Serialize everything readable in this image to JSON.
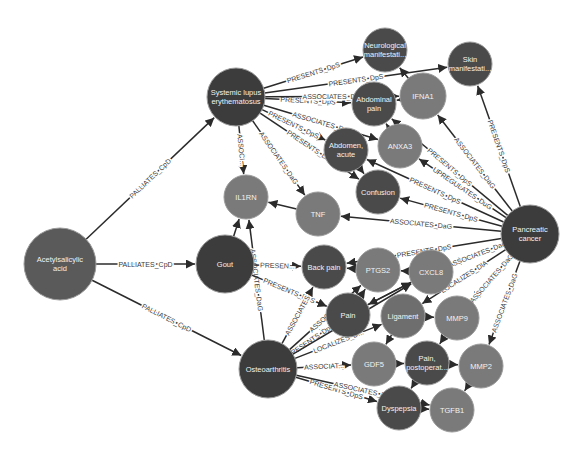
{
  "colors": {
    "background": "#ffffff",
    "compound": "#5a5a5a",
    "disease": "#3c3c3c",
    "symptom": "#4a4a4a",
    "gene": "#7a7a7a",
    "anatomy": "#6e6e6e",
    "edge": "#2b2b2b",
    "label_light": "#f2f2f2"
  },
  "nodes": [
    {
      "id": "acetylsalicylic_acid",
      "lines": [
        "Acetylsalicylic",
        "acid"
      ],
      "x": 60,
      "y": 264,
      "r": 36,
      "type": "compound"
    },
    {
      "id": "sle",
      "lines": [
        "Systemic lupus",
        "erythematosus"
      ],
      "x": 236,
      "y": 97,
      "r": 29,
      "type": "disease"
    },
    {
      "id": "il1rn",
      "lines": [
        "IL1RN"
      ],
      "x": 246,
      "y": 197,
      "r": 22,
      "type": "gene"
    },
    {
      "id": "gout",
      "lines": [
        "Gout"
      ],
      "x": 225,
      "y": 264,
      "r": 29,
      "type": "disease"
    },
    {
      "id": "osteoarthritis",
      "lines": [
        "Osteoarthritis"
      ],
      "x": 268,
      "y": 369,
      "r": 29,
      "type": "disease"
    },
    {
      "id": "neuro",
      "lines": [
        "Neurological",
        "manifestati..."
      ],
      "x": 385,
      "y": 50,
      "r": 22,
      "type": "symptom"
    },
    {
      "id": "skin",
      "lines": [
        "Skin",
        "manifestati..."
      ],
      "x": 470,
      "y": 64,
      "r": 22,
      "type": "symptom"
    },
    {
      "id": "abdominal_pain",
      "lines": [
        "Abdominal",
        "pain"
      ],
      "x": 374,
      "y": 104,
      "r": 22,
      "type": "symptom"
    },
    {
      "id": "ifna1",
      "lines": [
        "IFNA1"
      ],
      "x": 423,
      "y": 96,
      "r": 23,
      "type": "gene"
    },
    {
      "id": "abdomen_acute",
      "lines": [
        "Abdomen,",
        "acute"
      ],
      "x": 346,
      "y": 150,
      "r": 22,
      "type": "symptom"
    },
    {
      "id": "anxa3",
      "lines": [
        "ANXA3"
      ],
      "x": 400,
      "y": 146,
      "r": 22,
      "type": "gene"
    },
    {
      "id": "confusion",
      "lines": [
        "Confusion"
      ],
      "x": 378,
      "y": 192,
      "r": 22,
      "type": "symptom"
    },
    {
      "id": "tnf",
      "lines": [
        "TNF"
      ],
      "x": 318,
      "y": 214,
      "r": 22,
      "type": "gene"
    },
    {
      "id": "pancreatic_cancer",
      "lines": [
        "Pancreatic",
        "cancer"
      ],
      "x": 530,
      "y": 234,
      "r": 29,
      "type": "disease"
    },
    {
      "id": "back_pain",
      "lines": [
        "Back pain"
      ],
      "x": 324,
      "y": 267,
      "r": 22,
      "type": "symptom"
    },
    {
      "id": "ptgs2",
      "lines": [
        "PTGS2"
      ],
      "x": 378,
      "y": 270,
      "r": 22,
      "type": "gene"
    },
    {
      "id": "cxcl8",
      "lines": [
        "CXCL8"
      ],
      "x": 431,
      "y": 272,
      "r": 22,
      "type": "gene"
    },
    {
      "id": "pain",
      "lines": [
        "Pain"
      ],
      "x": 348,
      "y": 315,
      "r": 22,
      "type": "symptom"
    },
    {
      "id": "ligament",
      "lines": [
        "Ligament"
      ],
      "x": 403,
      "y": 316,
      "r": 22,
      "type": "anatomy"
    },
    {
      "id": "mmp9",
      "lines": [
        "MMP9"
      ],
      "x": 457,
      "y": 318,
      "r": 22,
      "type": "gene"
    },
    {
      "id": "gdf5",
      "lines": [
        "GDF5"
      ],
      "x": 374,
      "y": 364,
      "r": 22,
      "type": "gene"
    },
    {
      "id": "pain_postop",
      "lines": [
        "Pain,",
        "postoperat..."
      ],
      "x": 427,
      "y": 363,
      "r": 22,
      "type": "symptom"
    },
    {
      "id": "mmp2",
      "lines": [
        "MMP2"
      ],
      "x": 481,
      "y": 366,
      "r": 22,
      "type": "gene"
    },
    {
      "id": "dyspepsia",
      "lines": [
        "Dyspepsia"
      ],
      "x": 399,
      "y": 408,
      "r": 22,
      "type": "symptom"
    },
    {
      "id": "tgfb1",
      "lines": [
        "TGFB1"
      ],
      "x": 452,
      "y": 410,
      "r": 22,
      "type": "gene"
    }
  ],
  "edges": [
    {
      "from": "acetylsalicylic_acid",
      "to": "sle",
      "label": "PALLIATES_CpD"
    },
    {
      "from": "acetylsalicylic_acid",
      "to": "gout",
      "label": "PALLIATES_CpD"
    },
    {
      "from": "acetylsalicylic_acid",
      "to": "osteoarthritis",
      "label": "PALLIATES_CpD"
    },
    {
      "from": "sle",
      "to": "neuro",
      "label": "PRESENTS_DpS"
    },
    {
      "from": "sle",
      "to": "skin",
      "label": "PRESENTS_DpS"
    },
    {
      "from": "sle",
      "to": "abdominal_pain",
      "label": "PRESENTS_DpS"
    },
    {
      "from": "sle",
      "to": "ifna1",
      "label": "ASSOCIATES_D..."
    },
    {
      "from": "sle",
      "to": "anxa3",
      "label": "ASSOCIATES_D..."
    },
    {
      "from": "sle",
      "to": "abdomen_acute",
      "label": "PRESENTS_DpS"
    },
    {
      "from": "sle",
      "to": "confusion",
      "label": "PRESENTS_D..."
    },
    {
      "from": "sle",
      "to": "tnf",
      "label": "ASSOCIATES_DaG"
    },
    {
      "from": "sle",
      "to": "il1rn",
      "label": "ASSOCI..."
    },
    {
      "from": "gout",
      "to": "il1rn",
      "label": ""
    },
    {
      "from": "osteoarthritis",
      "to": "il1rn",
      "label": "ASSOCIATES_DaG"
    },
    {
      "from": "gout",
      "to": "back_pain",
      "label": "PRESEN..."
    },
    {
      "from": "gout",
      "to": "pain",
      "label": "PRESENTS_DpS"
    },
    {
      "from": "osteoarthritis",
      "to": "back_pain",
      "label": "ASSOCIATES"
    },
    {
      "from": "osteoarthritis",
      "to": "pain",
      "label": "PRESENTS_DpS"
    },
    {
      "from": "osteoarthritis",
      "to": "ptgs2",
      "label": "ASSOCIAT..."
    },
    {
      "from": "osteoarthritis",
      "to": "ligament",
      "label": "LOCALIZES_D..."
    },
    {
      "from": "osteoarthritis",
      "to": "cxcl8",
      "label": "ASSOCI..."
    },
    {
      "from": "osteoarthritis",
      "to": "gdf5",
      "label": "ASSOCIAT..."
    },
    {
      "from": "osteoarthritis",
      "to": "dyspepsia",
      "label": "PRESENTS_DpS"
    },
    {
      "from": "osteoarthritis",
      "to": "tgfb1",
      "label": "ASSOCIATES_D..."
    },
    {
      "from": "tnf",
      "to": "il1rn",
      "label": ""
    },
    {
      "from": "pancreatic_cancer",
      "to": "skin",
      "label": "PRESENTS_DpS"
    },
    {
      "from": "pancreatic_cancer",
      "to": "ifna1",
      "label": "ASSOCIATES_DaG"
    },
    {
      "from": "pancreatic_cancer",
      "to": "abdominal_pain",
      "label": "PRESENTS_DpS"
    },
    {
      "from": "pancreatic_cancer",
      "to": "anxa3",
      "label": "UPREGULATES_DuG"
    },
    {
      "from": "pancreatic_cancer",
      "to": "abdomen_acute",
      "label": "PRESENTS_DpS"
    },
    {
      "from": "pancreatic_cancer",
      "to": "confusion",
      "label": "PRESENTS_DpS"
    },
    {
      "from": "pancreatic_cancer",
      "to": "tnf",
      "label": "ASSOCIATES_DaG"
    },
    {
      "from": "pancreatic_cancer",
      "to": "back_pain",
      "label": "PRESENTS_DpS"
    },
    {
      "from": "pancreatic_cancer",
      "to": "cxcl8",
      "label": "ASSOCIATES_DaG"
    },
    {
      "from": "pancreatic_cancer",
      "to": "ligament",
      "label": "LOCALIZES_DlA"
    },
    {
      "from": "pancreatic_cancer",
      "to": "mmp9",
      "label": "ASSOCIATES_DaG"
    },
    {
      "from": "pancreatic_cancer",
      "to": "mmp2",
      "label": "ASSOCIATES_DaG"
    },
    {
      "from": "ifna1",
      "to": "neuro",
      "label": ""
    },
    {
      "from": "ifna1",
      "to": "abdominal_pain",
      "label": ""
    },
    {
      "from": "anxa3",
      "to": "abdominal_pain",
      "label": ""
    },
    {
      "from": "abdomen_acute",
      "to": "confusion",
      "label": ""
    },
    {
      "from": "ptgs2",
      "to": "back_pain",
      "label": ""
    },
    {
      "from": "cxcl8",
      "to": "ptgs2",
      "label": ""
    },
    {
      "from": "pain",
      "to": "ptgs2",
      "label": ""
    },
    {
      "from": "pain",
      "to": "cxcl8",
      "label": ""
    },
    {
      "from": "cxcl8",
      "to": "pain",
      "label": ""
    },
    {
      "from": "ligament",
      "to": "mmp9",
      "label": ""
    },
    {
      "from": "ligament",
      "to": "gdf5",
      "label": ""
    },
    {
      "from": "mmp9",
      "to": "pain_postop",
      "label": ""
    },
    {
      "from": "gdf5",
      "to": "pain_postop",
      "label": ""
    },
    {
      "from": "pain_postop",
      "to": "mmp2",
      "label": ""
    },
    {
      "from": "pain_postop",
      "to": "dyspepsia",
      "label": ""
    },
    {
      "from": "mmp2",
      "to": "tgfb1",
      "label": ""
    },
    {
      "from": "dyspepsia",
      "to": "tgfb1",
      "label": ""
    }
  ]
}
